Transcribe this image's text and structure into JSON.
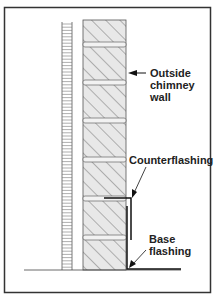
{
  "diagram": {
    "type": "chimney flashing cross-section",
    "labels": {
      "outside_wall_line1": "Outside",
      "outside_wall_line2": "chimney",
      "outside_wall_line3": "wall",
      "counterflashing": "Counterflashing",
      "base_flashing_line1": "Base",
      "base_flashing_line2": "flashing"
    },
    "components": [
      "flue liner",
      "outside chimney wall (brick)",
      "mortar joints",
      "counterflashing",
      "base flashing",
      "roof line"
    ],
    "colors": {
      "frame": "#333333",
      "brick_fill": "#e6e6e6",
      "mortar_fill": "#f0f0f0",
      "line": "#444444",
      "flashing": "#111111"
    }
  }
}
